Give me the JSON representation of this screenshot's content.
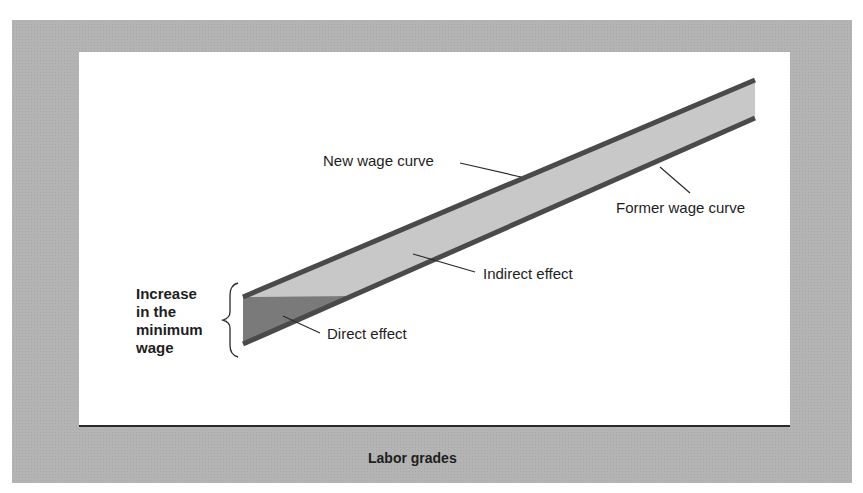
{
  "diagram": {
    "labels": {
      "new_wage_curve": "New wage curve",
      "former_wage_curve": "Former wage curve",
      "indirect_effect": "Indirect effect",
      "direct_effect": "Direct effect",
      "increase_min_wage": "Increase\nin the\nminimum\nwage",
      "x_axis": "Labor grades"
    },
    "colors": {
      "frame": "#b4b4b4",
      "panel": "#ffffff",
      "band_fill": "#c8c8c8",
      "direct_effect_fill": "#7a7a7a",
      "curve_stroke": "#4a4a4a",
      "axis": "#2a2a2a"
    },
    "geometry": {
      "new_wage_curve": {
        "x1": 243,
        "y1": 297,
        "x2": 755,
        "y2": 80
      },
      "former_wage_curve": {
        "x1": 243,
        "y1": 344,
        "x2": 755,
        "y2": 118
      },
      "direct_effect_triangle": [
        [
          243,
          297
        ],
        [
          350,
          297
        ],
        [
          243,
          344
        ]
      ]
    }
  }
}
